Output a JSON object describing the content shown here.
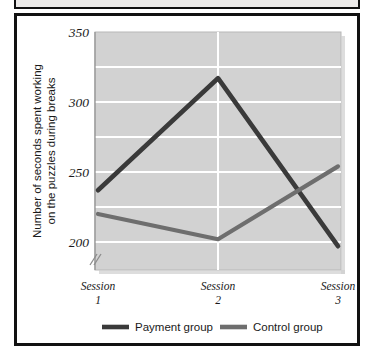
{
  "figure": {
    "frame_color": "#111111",
    "background": "#ffffff"
  },
  "chart_data": {
    "type": "line",
    "title": "",
    "subtitle": "",
    "xlabel": "",
    "ylabel": "Number of seconds spent working on the puzzles during breaks",
    "ylabel_line1": "Number of seconds spent working",
    "ylabel_line2": "on the puzzles during breaks",
    "categories": [
      "Session 1",
      "Session 2",
      "Session 3"
    ],
    "category_lines": [
      [
        "Session",
        "1"
      ],
      [
        "Session",
        "2"
      ],
      [
        "Session",
        "3"
      ]
    ],
    "ylim": [
      180,
      350
    ],
    "ytick_labels": [
      "350",
      "300",
      "250",
      "200"
    ],
    "ytick_values": [
      350,
      300,
      250,
      200
    ],
    "minor_gridline_values": [
      325,
      275,
      225
    ],
    "axis_break": true,
    "axis_break_symbol": "//",
    "grid": true,
    "grid_color": "#ffffff",
    "vertical_gridline_values": [
      2
    ],
    "plot_background": "#d2d2d2",
    "legend_position": "bottom",
    "series": [
      {
        "name": "Payment group",
        "color": "#3a3a3a",
        "values": [
          237,
          317,
          197
        ]
      },
      {
        "name": "Control group",
        "color": "#6e6e6e",
        "values": [
          220,
          202,
          254
        ]
      }
    ]
  },
  "legend": {
    "items": [
      {
        "label": "Payment group",
        "color": "#3a3a3a"
      },
      {
        "label": "Control group",
        "color": "#6e6e6e"
      }
    ]
  }
}
